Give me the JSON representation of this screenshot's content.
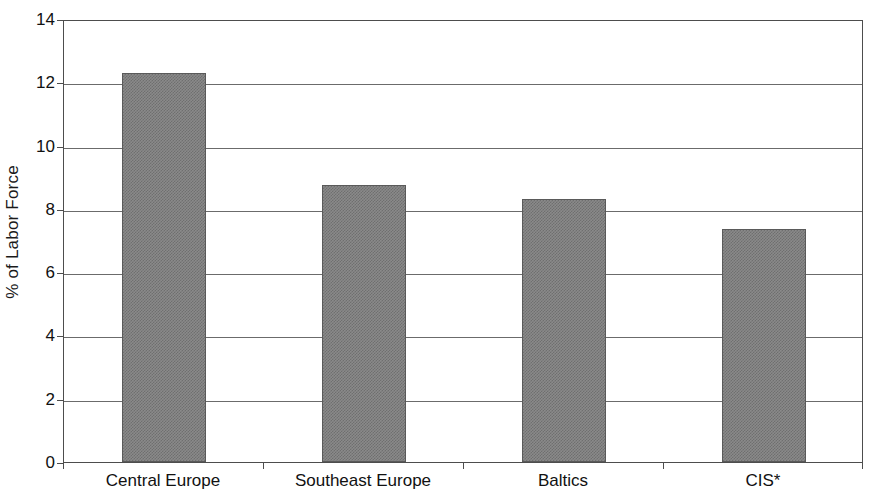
{
  "chart_data": {
    "type": "bar",
    "title": "",
    "subtitle": "",
    "xlabel": "",
    "ylabel": "% of Labor Force",
    "categories": [
      "Central Europe",
      "Southeast Europe",
      "Baltics",
      "CIS*"
    ],
    "values": [
      12.3,
      8.75,
      8.3,
      7.35
    ],
    "ylim": [
      0,
      14
    ],
    "ytick_labels": [
      "0",
      "2",
      "4",
      "6",
      "8",
      "10",
      "12",
      "14"
    ],
    "ytick_values": [
      0,
      2,
      4,
      6,
      8,
      10,
      12,
      14
    ],
    "grid": true,
    "legend": "none",
    "series_name": "Unemployment",
    "bar_color": "#8a8a8a",
    "bar_edge_color": "#5a5a5a",
    "gridline_color": "#6b6b6b",
    "axis_color": "#4d4d4d",
    "background_color": "#ffffff",
    "annotations": [
      "CIS*"
    ]
  }
}
